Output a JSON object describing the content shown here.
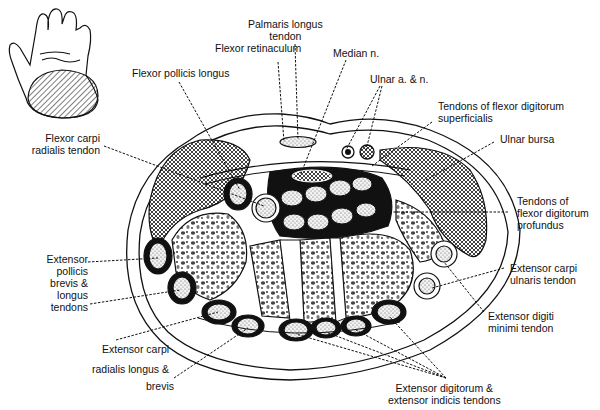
{
  "diagram": {
    "inset": "hand-palm-view-with-hatched-wrist-section",
    "colors": {
      "ink": "#111111",
      "background": "#ffffff",
      "fill_light": "#d9d9d9"
    }
  },
  "labels": {
    "palmaris_longus": "Palmaris longus\ntendon",
    "flexor_retinaculum": "Flexor retinaculum",
    "median_n": "Median n.",
    "flexor_pollicis_longus": "Flexor pollicis longus",
    "ulnar_a_n": "Ulnar a. & n.",
    "fds_tendons": "Tendons of flexor digitorum\nsuperficialis",
    "ulnar_bursa": "Ulnar bursa",
    "fcr_tendon": "Flexor carpi\nradialis tendon",
    "fdp_tendons": "Tendons of\nflexor digitorum\nprofundus",
    "epb_epl": "Extensor\npollicis\nbrevis &\nlongus\ntendons",
    "ecu_tendon": "Extensor carpi\nulnaris tendon",
    "edm_tendon": "Extensor digiti\nminimi tendon",
    "ecrl_ecrb_1": "Extensor carpi",
    "ecrl_ecrb_2": "radialis longus &",
    "ecrl_ecrb_3": "brevis",
    "ed_ei": "Extensor digitorum &\nextensor indicis tendons"
  }
}
